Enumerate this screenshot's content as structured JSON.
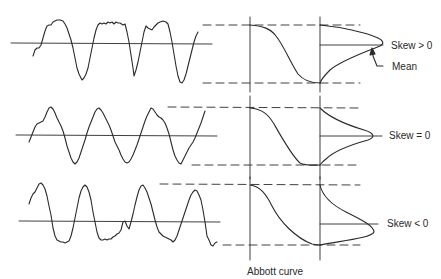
{
  "diagram": {
    "caption": "Abbott curve",
    "colors": {
      "ink": "#2a2a2a",
      "background": "#ffffff"
    },
    "panels": [
      {
        "id": "positive-skew",
        "skew_label": "Skew > 0",
        "mean_label": "Mean"
      },
      {
        "id": "zero-skew",
        "skew_label": "Skew = 0"
      },
      {
        "id": "negative-skew",
        "skew_label": "Skew < 0"
      }
    ]
  }
}
